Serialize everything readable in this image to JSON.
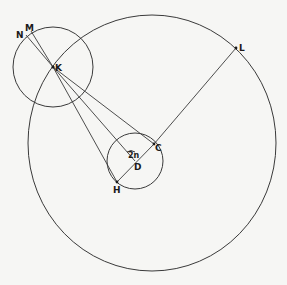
{
  "diagram": {
    "colors": {
      "background": "#f6f6f4",
      "stroke": "#3a3a3a",
      "label": "#1a1a1a"
    },
    "labels": {
      "N": "N",
      "M": "M",
      "K": "K",
      "L": "L",
      "C": "C",
      "D": "D",
      "H": "H",
      "angle": "2n"
    },
    "shapes": {
      "large_circle": {
        "cx": 152,
        "cy": 143,
        "rx": 124,
        "ry": 128
      },
      "circle_K": {
        "cx": 53,
        "cy": 67,
        "r": 40
      },
      "circle_D": {
        "cx": 135,
        "cy": 161,
        "r": 28
      }
    },
    "points": {
      "N": [
        26,
        35
      ],
      "M": [
        31,
        31
      ],
      "K": [
        53,
        67
      ],
      "L": [
        236,
        48
      ],
      "C": [
        154,
        144
      ],
      "D": [
        135,
        161
      ],
      "H": [
        117,
        182
      ]
    },
    "segments": [
      "K-N",
      "K-M",
      "K-C",
      "K-D",
      "K-H",
      "C-H",
      "C-L"
    ]
  }
}
